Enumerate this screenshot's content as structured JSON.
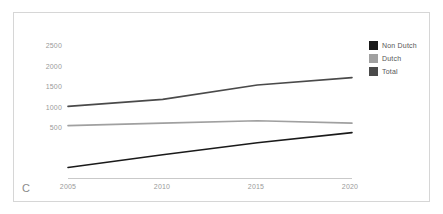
{
  "figure": {
    "panel_letter": "C",
    "background_color": "#ffffff",
    "border_color": "#d6d6d6"
  },
  "chart_data": {
    "type": "line",
    "title": "",
    "xlabel": "",
    "ylabel": "",
    "x": [
      2005,
      2010,
      2015,
      2020
    ],
    "categories": [
      "2005",
      "2010",
      "2015",
      "2020"
    ],
    "xtick_labels": [
      "2005",
      "2010",
      "2015",
      "2020"
    ],
    "ytick_labels": [
      "500",
      "1000",
      "1500",
      "2000",
      "2500"
    ],
    "yticks": [
      500,
      1000,
      1500,
      2000,
      2500
    ],
    "ylim": [
      0,
      2650
    ],
    "xlim": [
      2004,
      2021
    ],
    "grid": false,
    "legend_position": "right",
    "series": [
      {
        "name": "Non Dutch",
        "color": "#1a1a1a",
        "values": [
          270,
          580,
          870,
          1120
        ]
      },
      {
        "name": "Dutch",
        "color": "#a0a0a0",
        "values": [
          1290,
          1350,
          1410,
          1350
        ]
      },
      {
        "name": "Total",
        "color": "#4a4a4a",
        "values": [
          1760,
          1930,
          2280,
          2460
        ]
      }
    ]
  },
  "axes": {
    "axis_line_color": "#c9c9c9",
    "tick_label_color": "#9a9a9a"
  }
}
